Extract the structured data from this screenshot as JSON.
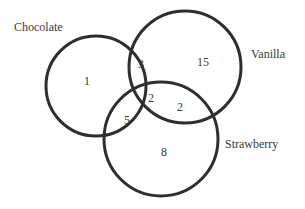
{
  "diagram": {
    "type": "venn",
    "sets": [
      {
        "name": "Chocolate",
        "label": "Chocolate",
        "cx": 96,
        "cy": 86,
        "r": 50,
        "label_x": 14,
        "label_y": 31
      },
      {
        "name": "Vanilla",
        "label": "Vanilla",
        "cx": 185,
        "cy": 67,
        "r": 56,
        "label_x": 251,
        "label_y": 58
      },
      {
        "name": "Strawberry",
        "label": "Strawberry",
        "cx": 161,
        "cy": 139,
        "r": 57,
        "label_x": 225,
        "label_y": 148
      }
    ],
    "regions": [
      {
        "id": "chocolate_only",
        "sets": [
          "Chocolate"
        ],
        "value": "1",
        "x": 87,
        "y": 85
      },
      {
        "id": "chocolate_vanilla",
        "sets": [
          "Chocolate",
          "Vanilla"
        ],
        "value": "3",
        "x": 141,
        "y": 68
      },
      {
        "id": "vanilla_only",
        "sets": [
          "Vanilla"
        ],
        "value": "15",
        "x": 203,
        "y": 66
      },
      {
        "id": "all_three",
        "sets": [
          "Chocolate",
          "Vanilla",
          "Strawberry"
        ],
        "value": "2",
        "x": 151,
        "y": 102
      },
      {
        "id": "vanilla_strawberry",
        "sets": [
          "Vanilla",
          "Strawberry"
        ],
        "value": "2",
        "x": 180,
        "y": 111
      },
      {
        "id": "chocolate_strawberry",
        "sets": [
          "Chocolate",
          "Strawberry"
        ],
        "value": "5",
        "x": 127,
        "y": 124
      },
      {
        "id": "strawberry_only",
        "sets": [
          "Strawberry"
        ],
        "value": "8",
        "x": 164,
        "y": 156
      }
    ]
  }
}
